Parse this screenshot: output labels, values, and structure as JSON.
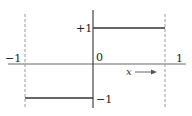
{
  "diagram": {
    "type": "step-function",
    "labels": {
      "x_left": "−1",
      "x_right": "1",
      "origin": "0",
      "y_top": "+1",
      "y_bottom": "−1",
      "x_axis_variable": "x"
    },
    "segments": [
      {
        "from_x": -1,
        "to_x": 0,
        "y": -1
      },
      {
        "from_x": 0,
        "to_x": 1,
        "y": 1
      }
    ],
    "bounds": {
      "x": [
        -1,
        1
      ],
      "y": [
        -1,
        1
      ]
    },
    "colors": {
      "line": "#333333",
      "axis": "#555555",
      "dashed": "#999999"
    }
  }
}
